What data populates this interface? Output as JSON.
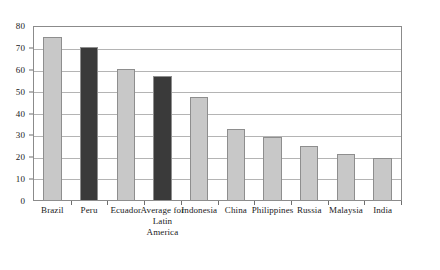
{
  "chart_data": {
    "type": "bar",
    "title": "",
    "subtitle": "",
    "xlabel": "",
    "ylabel": "",
    "categories": [
      "Brazil",
      "Peru",
      "Ecuador",
      "Average for Latin America",
      "Indonesia",
      "China",
      "Philippines",
      "Russia",
      "Malaysia",
      "India"
    ],
    "values": [
      75.5,
      71,
      60.5,
      57.5,
      48,
      33,
      29.5,
      25.5,
      21.5,
      20
    ],
    "ylim": [
      0,
      80
    ],
    "ytick_values": [
      0,
      10,
      20,
      30,
      40,
      50,
      60,
      70,
      80
    ],
    "ytick_labels": [
      "0",
      "10",
      "20",
      "30",
      "40",
      "50",
      "60",
      "70",
      "80"
    ],
    "grid": true,
    "grid_axis": "y",
    "legend": false,
    "legend_position": "none",
    "bar_colors": [
      "#c8c8c8",
      "#3a3a3a",
      "#c8c8c8",
      "#3a3a3a",
      "#c8c8c8",
      "#c8c8c8",
      "#c8c8c8",
      "#c8c8c8",
      "#c8c8c8",
      "#c8c8c8"
    ],
    "highlight_color": "#3a3a3a",
    "default_color": "#c8c8c8",
    "bar_edge_color": "#8e8e8e",
    "axis_color": "#8b8b8b",
    "gridline_color": "#b4b4b4",
    "background_color": "#ffffff"
  }
}
